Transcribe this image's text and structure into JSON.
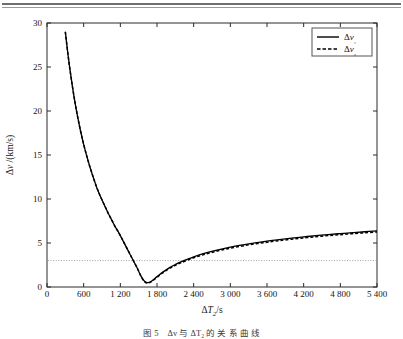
{
  "figure": {
    "caption": "图 5　Δv 与 ΔT₂ 的 关 系 曲 线"
  },
  "chart_data": {
    "type": "line",
    "title": "",
    "xlabel": "ΔT₂/s",
    "ylabel": "Δv /(km/s)",
    "xlim": [
      0,
      5400
    ],
    "ylim": [
      0,
      30
    ],
    "xticks": [
      0,
      600,
      1200,
      1800,
      2400,
      3000,
      3600,
      4200,
      4800,
      5400
    ],
    "xtick_labels": [
      "0",
      "600",
      "1 200",
      "1 800",
      "2 400",
      "3 000",
      "3 600",
      "4 200",
      "4 800",
      "5 400"
    ],
    "yticks": [
      0,
      5,
      10,
      15,
      20,
      25,
      30
    ],
    "ytick_labels": [
      "0",
      "5",
      "10",
      "15",
      "20",
      "25",
      "30"
    ],
    "grid": false,
    "legend_position": "top-right",
    "legend": [
      {
        "name": "Δv₁",
        "style": "solid",
        "color": "#000000"
      },
      {
        "name": "Δv₂",
        "style": "dashed",
        "color": "#000000"
      }
    ],
    "reference_lines": [
      {
        "orientation": "horizontal",
        "value": 3.0,
        "style": "dotted",
        "color": "#9e9e9e"
      }
    ],
    "series": [
      {
        "name": "Δv₁",
        "style": "solid",
        "color": "#000000",
        "x": [
          300,
          340,
          380,
          420,
          460,
          500,
          550,
          600,
          650,
          700,
          760,
          820,
          880,
          940,
          1000,
          1060,
          1120,
          1180,
          1240,
          1300,
          1360,
          1420,
          1480,
          1540,
          1600,
          1660,
          1720,
          1800,
          1900,
          2000,
          2100,
          2200,
          2400,
          2600,
          2800,
          3000,
          3200,
          3400,
          3600,
          3800,
          4000,
          4200,
          4400,
          4600,
          4800,
          5000,
          5200,
          5400
        ],
        "y": [
          29.0,
          26.6,
          24.5,
          22.6,
          20.9,
          19.4,
          17.7,
          16.2,
          14.9,
          13.7,
          12.4,
          11.2,
          10.2,
          9.3,
          8.4,
          7.6,
          6.8,
          6.1,
          5.3,
          4.5,
          3.7,
          2.9,
          2.1,
          1.2,
          0.62,
          0.5,
          0.72,
          1.18,
          1.72,
          2.18,
          2.56,
          2.88,
          3.43,
          3.87,
          4.23,
          4.53,
          4.79,
          5.01,
          5.21,
          5.39,
          5.55,
          5.7,
          5.83,
          5.96,
          6.07,
          6.18,
          6.28,
          6.37
        ]
      },
      {
        "name": "Δv₂",
        "style": "dashed",
        "color": "#000000",
        "x": [
          300,
          340,
          380,
          420,
          460,
          500,
          550,
          600,
          650,
          700,
          760,
          820,
          880,
          940,
          1000,
          1060,
          1120,
          1180,
          1240,
          1300,
          1360,
          1420,
          1480,
          1540,
          1600,
          1660,
          1720,
          1800,
          1900,
          2000,
          2100,
          2200,
          2400,
          2600,
          2800,
          3000,
          3200,
          3400,
          3600,
          3800,
          4000,
          4200,
          4400,
          4600,
          4800,
          5000,
          5200,
          5400
        ],
        "y": [
          29.0,
          26.6,
          24.5,
          22.6,
          20.9,
          19.4,
          17.7,
          16.2,
          14.9,
          13.7,
          12.4,
          11.2,
          10.2,
          9.3,
          8.4,
          7.6,
          6.8,
          6.1,
          5.3,
          4.5,
          3.7,
          2.9,
          2.1,
          1.2,
          0.58,
          0.45,
          0.66,
          1.1,
          1.63,
          2.08,
          2.46,
          2.78,
          3.32,
          3.75,
          4.11,
          4.41,
          4.67,
          4.89,
          5.09,
          5.27,
          5.43,
          5.58,
          5.71,
          5.84,
          5.95,
          6.06,
          6.16,
          6.25
        ]
      }
    ]
  }
}
